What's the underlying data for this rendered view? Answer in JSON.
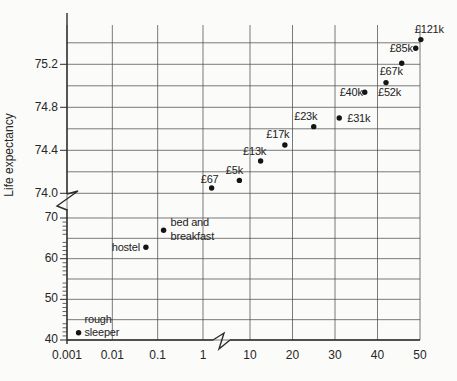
{
  "figure": {
    "background": "#fbfbfa",
    "line_color": "#2d2d2d",
    "grid_color": "#4f4f4f",
    "dot_color": "#141414"
  },
  "chart_data": {
    "type": "scatter",
    "title": "",
    "xlabel": "",
    "ylabel": "Life expectancy",
    "grid": true,
    "legend": "none",
    "x_axis": {
      "broken": true,
      "break_between": [
        1,
        10
      ],
      "segments": [
        {
          "scale": "log",
          "min": 0.001,
          "max": 1,
          "tick_values": [
            0.001,
            0.01,
            0.1,
            1
          ],
          "tick_labels": [
            "0.001",
            "0.01",
            "0.1",
            "1"
          ]
        },
        {
          "scale": "linear",
          "min": 10,
          "max": 50,
          "tick_values": [
            10,
            20,
            30,
            40,
            50
          ],
          "tick_labels": [
            "10",
            "20",
            "30",
            "40",
            "50"
          ]
        }
      ]
    },
    "y_axis": {
      "label": "Life expectancy",
      "broken": true,
      "break_between": [
        70,
        74.0
      ],
      "segments": [
        {
          "scale": "linear",
          "min": 40,
          "max": 70,
          "grid_step": 5,
          "minor_tick_step": 1,
          "tick_values": [
            40,
            50,
            60,
            70
          ],
          "tick_labels": [
            "40",
            "50",
            "60",
            "70"
          ]
        },
        {
          "scale": "linear",
          "min": 74.0,
          "max": 75.4,
          "grid_step": 0.2,
          "tick_values": [
            74.0,
            74.4,
            74.8,
            75.2
          ],
          "tick_labels": [
            "74.0",
            "74.4",
            "74.8",
            "75.2"
          ]
        }
      ]
    },
    "points": [
      {
        "label": [
          "rough",
          "sleeper"
        ],
        "x": 0.0018,
        "y": 41.8,
        "anchor": "start",
        "dx": 6,
        "dy": -10,
        "lh": 13
      },
      {
        "label": [
          "hostel"
        ],
        "x": 0.055,
        "y": 62.8,
        "anchor": "end",
        "dx": -6,
        "dy": 4,
        "lh": 13
      },
      {
        "label": [
          "bed and",
          "breakfast"
        ],
        "x": 0.135,
        "y": 67.0,
        "anchor": "start",
        "dx": 7,
        "dy": -4,
        "lh": 14
      },
      {
        "label": [
          "£67"
        ],
        "x": 1.55,
        "y": 74.05,
        "anchor": "middle",
        "dx": -2,
        "dy": -5,
        "lh": 13
      },
      {
        "label": [
          "£5k"
        ],
        "x": 7.5,
        "y": 74.12,
        "anchor": "middle",
        "dx": -5,
        "dy": -6,
        "lh": 13
      },
      {
        "label": [
          "£13k"
        ],
        "x": 12.5,
        "y": 74.3,
        "anchor": "middle",
        "dx": -6,
        "dy": -6,
        "lh": 13
      },
      {
        "label": [
          "£17k"
        ],
        "x": 18.2,
        "y": 74.45,
        "anchor": "middle",
        "dx": -7,
        "dy": -7,
        "lh": 13
      },
      {
        "label": [
          "£23k"
        ],
        "x": 25,
        "y": 74.62,
        "anchor": "middle",
        "dx": -8,
        "dy": -7,
        "lh": 13
      },
      {
        "label": [
          "£31k"
        ],
        "x": 31,
        "y": 74.7,
        "anchor": "start",
        "dx": 8,
        "dy": 4,
        "lh": 13
      },
      {
        "label": [
          "£40k"
        ],
        "x": 37,
        "y": 74.94,
        "anchor": "end",
        "dx": -2,
        "dy": 4,
        "lh": 13
      },
      {
        "label": [
          "£52k"
        ],
        "x": 42,
        "y": 75.03,
        "anchor": "start",
        "dx": -8,
        "dy": 13,
        "lh": 13
      },
      {
        "label": [
          "£67k"
        ],
        "x": 45.7,
        "y": 75.21,
        "anchor": "end",
        "dx": 1,
        "dy": 12,
        "lh": 13
      },
      {
        "label": [
          "£85k"
        ],
        "x": 49,
        "y": 75.35,
        "anchor": "end",
        "dx": -3,
        "dy": 4,
        "lh": 13
      },
      {
        "label": [
          "£121k"
        ],
        "x": 50.2,
        "y": 75.43,
        "anchor": "start",
        "dx": -6,
        "dy": -7,
        "lh": 13
      }
    ]
  }
}
